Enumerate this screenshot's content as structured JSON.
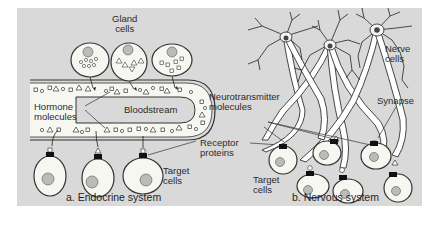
{
  "figure": {
    "background_color": "#d9d9d9",
    "panel_a": {
      "caption": "a. Endocrine system",
      "labels": {
        "gland_cells_1": "Gland",
        "gland_cells_2": "cells",
        "hormone_1": "Hormone",
        "hormone_2": "molecules",
        "bloodstream": "Bloodstream",
        "target_1": "Target",
        "target_2": "cells"
      }
    },
    "panel_b": {
      "caption": "b. Nervous system",
      "labels": {
        "nerve_1": "Nerve",
        "nerve_2": "cells",
        "neurotransmitter_1": "Neurotransmitter",
        "neurotransmitter_2": "molecules",
        "synapse": "Synapse",
        "receptor_1": "Receptor",
        "receptor_2": "proteins",
        "target_1": "Target",
        "target_2": "cells"
      }
    }
  }
}
